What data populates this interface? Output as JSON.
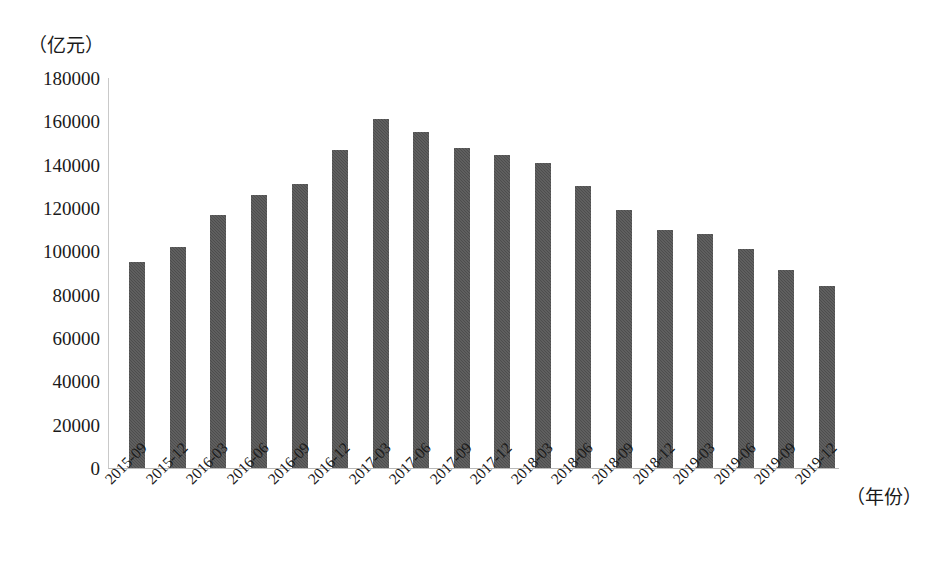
{
  "chart_data": {
    "type": "bar",
    "title": "",
    "subtitle": "",
    "xlabel": "（年份）",
    "ylabel": "（亿元）",
    "categories": [
      "2015-09",
      "2015-12",
      "2016-03",
      "2016-06",
      "2016-09",
      "2016-12",
      "2017-03",
      "2017-06",
      "2017-09",
      "2017-12",
      "2018-03",
      "2018-06",
      "2018-09",
      "2018-12",
      "2019-03",
      "2019-06",
      "2019-09",
      "2019-12"
    ],
    "values": [
      95000,
      102000,
      117000,
      126000,
      131000,
      147000,
      161000,
      155000,
      147500,
      144500,
      141000,
      130000,
      119000,
      110000,
      108000,
      101000,
      91500,
      84000
    ],
    "series": [
      {
        "name": "规模",
        "values": [
          95000,
          102000,
          117000,
          126000,
          131000,
          147000,
          161000,
          155000,
          147500,
          144500,
          141000,
          130000,
          119000,
          110000,
          108000,
          101000,
          91500,
          84000
        ]
      }
    ],
    "ylim": [
      0,
      180000
    ],
    "yticks": [
      0,
      20000,
      40000,
      60000,
      80000,
      100000,
      120000,
      140000,
      160000,
      180000
    ],
    "ytick_labels": [
      "0",
      "20000",
      "40000",
      "60000",
      "80000",
      "100000",
      "120000",
      "140000",
      "160000",
      "180000"
    ],
    "grid": false,
    "legend": "none",
    "bar_color": "#4d4d4d",
    "axis_color": "#c0c0c0",
    "background": "#ffffff"
  }
}
